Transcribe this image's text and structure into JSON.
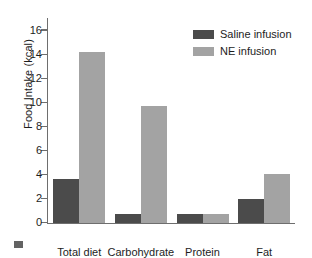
{
  "chart_data": {
    "type": "bar",
    "title": "",
    "xlabel": "",
    "ylabel": "Food Intake (kcal)",
    "ylim": [
      0,
      17
    ],
    "yticks": [
      0,
      2,
      4,
      6,
      8,
      10,
      12,
      14,
      16
    ],
    "ytick_labels": [
      "0",
      "2",
      "4",
      "6",
      "8",
      "10",
      "12",
      "14",
      "16"
    ],
    "grid": false,
    "legend_position": "top-right",
    "categories": [
      "Total diet",
      "Carbohydrate",
      "Protein",
      "Fat"
    ],
    "series": [
      {
        "name": "Saline infusion",
        "color": "#4b4b4b",
        "values": [
          3.6,
          0.75,
          0.75,
          2.0
        ]
      },
      {
        "name": "NE infusion",
        "color": "#a3a3a3",
        "values": [
          14.2,
          9.7,
          0.75,
          4.05
        ]
      }
    ]
  }
}
